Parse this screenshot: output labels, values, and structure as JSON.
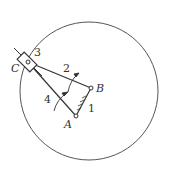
{
  "diagram": {
    "type": "mechanism-linkage",
    "points": {
      "A": {
        "label": "A"
      },
      "B": {
        "label": "B"
      },
      "C": {
        "label": "C"
      }
    },
    "links": [
      {
        "id": "1",
        "label": "1",
        "from": "A",
        "to": "B",
        "note": "ground/frame (hatched)"
      },
      {
        "id": "2",
        "label": "2",
        "from": "B",
        "to": "C"
      },
      {
        "id": "3",
        "label": "3",
        "note": "slider at C"
      },
      {
        "id": "4",
        "label": "4",
        "from": "A",
        "to": "C"
      }
    ],
    "circle": {
      "note": "trajectory of point C"
    }
  }
}
